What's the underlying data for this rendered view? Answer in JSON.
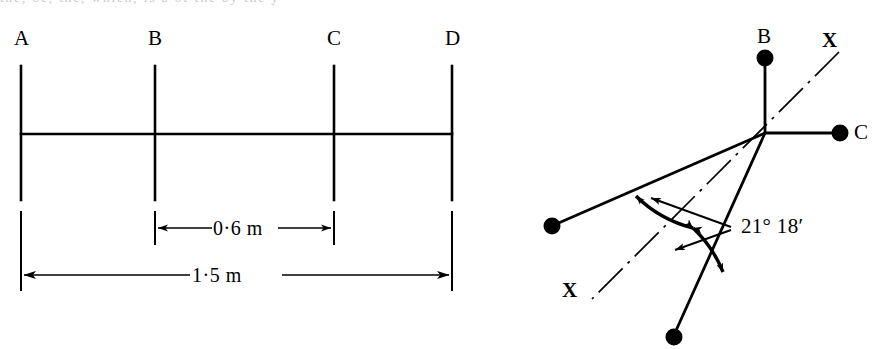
{
  "figure": {
    "background_color": "#ffffff",
    "ink_color": "#000000",
    "width": 887,
    "height": 349,
    "cut_off_line_above": "the, be, the, which, is a of the by the y"
  },
  "left_diagram": {
    "name": "beam-station-layout",
    "stations": [
      {
        "id": "A",
        "label": "A",
        "x": 21
      },
      {
        "id": "B",
        "label": "B",
        "x": 155
      },
      {
        "id": "C",
        "label": "C",
        "x": 334
      },
      {
        "id": "D",
        "label": "D",
        "x": 452
      }
    ],
    "dimensions": [
      {
        "id": "bc",
        "label": "0·6 m",
        "from": "B",
        "to": "C",
        "value": 0.6,
        "unit": "m"
      },
      {
        "id": "ad",
        "label": "1·5 m",
        "from": "A",
        "to": "D",
        "value": 1.5,
        "unit": "m"
      }
    ]
  },
  "right_diagram": {
    "name": "angular-deflection-diagram",
    "nodes": [
      {
        "id": "B",
        "label": "B",
        "show_label": true
      },
      {
        "id": "C",
        "label": "C",
        "show_label": true
      },
      {
        "id": "left",
        "label": "",
        "show_label": false
      },
      {
        "id": "bottom",
        "label": "",
        "show_label": false
      }
    ],
    "axis": {
      "id": "xx",
      "style": "dash-dot",
      "label_top": "X",
      "label_bottom": "X"
    },
    "angle": {
      "label": "21° 18′",
      "degrees": 21,
      "minutes": 18,
      "halves": 2
    }
  }
}
